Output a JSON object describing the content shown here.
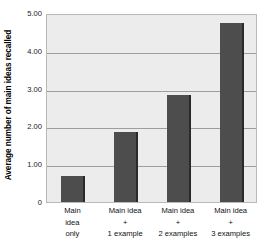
{
  "chart_data": {
    "type": "bar",
    "title": "",
    "xlabel": "",
    "ylabel": "Average number of main ideas recalled",
    "categories": [
      "Main idea only",
      "Main idea + 1 example",
      "Main idea + 2 examples",
      "Main idea + 3 examples"
    ],
    "category_lines": [
      [
        "Main",
        "idea",
        "only"
      ],
      [
        "Main idea",
        "+",
        "1 example"
      ],
      [
        "Main idea",
        "+",
        "2 examples"
      ],
      [
        "Main idea",
        "+",
        "3 examples"
      ]
    ],
    "values": [
      0.68,
      1.84,
      2.84,
      4.73
    ],
    "ylim": [
      0,
      5
    ],
    "yticks": [
      0,
      1,
      2,
      3,
      4,
      5
    ],
    "ytick_labels": [
      "0",
      "1.00",
      "2.00",
      "3.00",
      "4.00",
      "5.00"
    ],
    "grid": true,
    "legend": null,
    "colors": {
      "bar_fill": "#4d4d4d",
      "bar_edge": "#2a2a2a",
      "plot_background": "#ececec",
      "gridline": "#9e9e9e",
      "plot_border": "#b9b9b9",
      "figure_background": "#ffffff",
      "text": "#111111"
    }
  }
}
